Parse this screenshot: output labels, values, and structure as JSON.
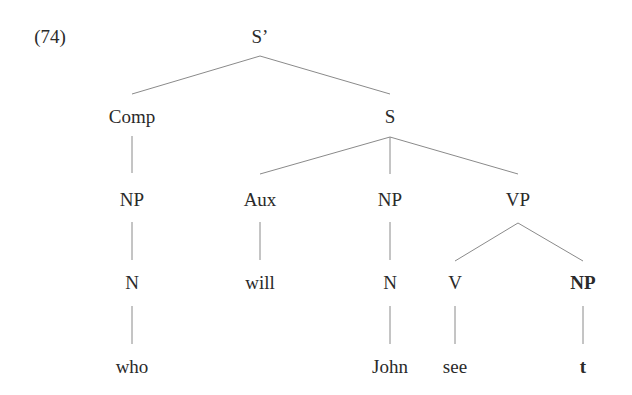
{
  "example_number": "(74)",
  "tree": {
    "nodes": {
      "sbar": "S’",
      "comp": "Comp",
      "s": "S",
      "comp_np": "NP",
      "aux": "Aux",
      "s_np": "NP",
      "vp": "VP",
      "comp_n": "N",
      "will": "will",
      "s_n": "N",
      "v": "V",
      "vp_np": "NP",
      "who": "who",
      "john": "John",
      "see": "see",
      "trace": "t"
    },
    "bold_nodes": [
      "vp_np",
      "trace"
    ],
    "edges": [
      [
        "sbar",
        "comp"
      ],
      [
        "sbar",
        "s"
      ],
      [
        "comp",
        "comp_np"
      ],
      [
        "comp_np",
        "comp_n"
      ],
      [
        "comp_n",
        "who"
      ],
      [
        "s",
        "aux"
      ],
      [
        "s",
        "s_np"
      ],
      [
        "s",
        "vp"
      ],
      [
        "aux",
        "will"
      ],
      [
        "s_np",
        "s_n"
      ],
      [
        "s_n",
        "john"
      ],
      [
        "vp",
        "v"
      ],
      [
        "vp",
        "vp_np"
      ],
      [
        "v",
        "see"
      ],
      [
        "vp_np",
        "trace"
      ]
    ]
  },
  "colors": {
    "text": "#2a2a2a",
    "edge": "#8a8a8a",
    "background": "#ffffff"
  }
}
